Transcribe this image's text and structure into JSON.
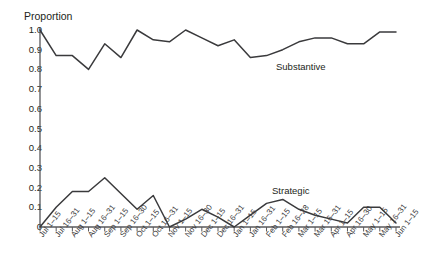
{
  "figure": {
    "caption_sliver": "",
    "y_axis_title": "Proportion"
  },
  "chart_data": {
    "type": "line",
    "title": "",
    "subtitle": "",
    "xlabel": "",
    "ylabel": "Proportion",
    "ylim": [
      0,
      1.0
    ],
    "ytick_labels": [
      "1.0",
      "0.9",
      "0.8",
      "0.7",
      "0.6",
      "0.5",
      "0.4",
      "0.3",
      "0.2",
      "0.1",
      "0"
    ],
    "ytick_values": [
      1.0,
      0.9,
      0.8,
      0.7,
      0.6,
      0.5,
      0.4,
      0.3,
      0.2,
      0.1,
      0
    ],
    "grid": false,
    "legend_position": "inline-annotation",
    "line_color": "#3a3a3c",
    "categories": [
      "Jul 1–15",
      "Jul 16–31",
      "Aug 1–15",
      "Aug 16–31",
      "Sep 1–15",
      "Sep 16–30",
      "Oct 1–15",
      "Oct 16–31",
      "Nov 1–15",
      "Nov 16–30",
      "Dec 1–15",
      "Dec 16–31",
      "Jan 1–15",
      "Jan 16–31",
      "Feb 1–15",
      "Feb 16–28",
      "Mar 1–15",
      "Mar 16–31",
      "Apr 1–15",
      "Apr 16–30",
      "May 1–15",
      "May 16–31",
      "Jun 1–15"
    ],
    "series": [
      {
        "name": "Substantive",
        "label_text": "Substantive",
        "values": [
          1.0,
          0.87,
          0.87,
          0.8,
          0.93,
          0.86,
          1.0,
          0.95,
          0.94,
          1.0,
          0.96,
          0.92,
          0.95,
          0.86,
          0.87,
          0.9,
          0.94,
          0.96,
          0.96,
          0.93,
          0.93,
          0.99,
          0.99
        ]
      },
      {
        "name": "Strategic",
        "label_text": "Strategic",
        "values": [
          0.0,
          0.1,
          0.18,
          0.18,
          0.25,
          0.17,
          0.09,
          0.16,
          0.0,
          0.04,
          0.09,
          0.05,
          0.0,
          0.06,
          0.12,
          0.14,
          0.09,
          0.06,
          0.04,
          0.02,
          0.1,
          0.1,
          0.02
        ]
      }
    ]
  }
}
